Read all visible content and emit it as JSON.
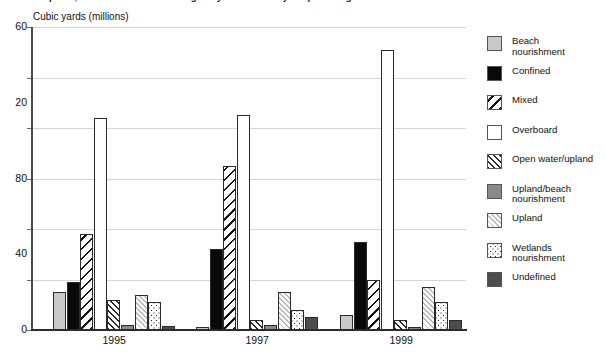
{
  "chart_title": "Disposal, 1995-1999: amount dredged by the U.S. Army Corps of Engineers",
  "y_axis_title": "Cubic yards (millions)",
  "legend": {
    "items": [
      {
        "label": "Beach\nnourishment",
        "pattern": "solid-light-gray",
        "key": "beach"
      },
      {
        "label": "Confined",
        "pattern": "solid-black",
        "key": "confined"
      },
      {
        "label": "Mixed",
        "pattern": "diagonal-hatch-coarse",
        "key": "mixed"
      },
      {
        "label": "Overboard",
        "pattern": "solid-white",
        "key": "overboard"
      },
      {
        "label": "Open water/upland",
        "pattern": "diagonal-hatch-fine",
        "key": "openwater"
      },
      {
        "label": "Upland/beach\nnourishment",
        "pattern": "solid-mid-gray",
        "key": "uplandbeach"
      },
      {
        "label": "Upland",
        "pattern": "diagonal-hatch-light",
        "key": "upland"
      },
      {
        "label": "Wetlands\nnourishment",
        "pattern": "dotted",
        "key": "wetlands"
      },
      {
        "label": "Undefined",
        "pattern": "solid-dark-gray",
        "key": "undefined"
      }
    ]
  },
  "chart_data": {
    "type": "bar",
    "title": "Disposal, 1995-1999: amount dredged by the U.S. Army Corps of Engineers",
    "xlabel": "",
    "ylabel": "Cubic yards (millions)",
    "categories": [
      "1995",
      "1997",
      "1999"
    ],
    "ytick_labels": [
      "60",
      "20",
      "80",
      "40",
      "0"
    ],
    "ytick_values": [
      60,
      50,
      40,
      30,
      20,
      10,
      0
    ],
    "ylim": [
      0,
      60
    ],
    "grid": true,
    "legend_position": "right",
    "series": [
      {
        "name": "Beach nourishment",
        "values": [
          7.5,
          0.5,
          3.0
        ]
      },
      {
        "name": "Confined",
        "values": [
          9.5,
          16.0,
          17.5
        ]
      },
      {
        "name": "Mixed",
        "values": [
          19.0,
          32.5,
          10.0
        ]
      },
      {
        "name": "Overboard",
        "values": [
          42.0,
          42.5,
          55.5
        ]
      },
      {
        "name": "Open water/upland",
        "values": [
          6.0,
          2.0,
          2.0
        ]
      },
      {
        "name": "Upland/beach nourishment",
        "values": [
          0.9,
          1.0,
          0.6
        ]
      },
      {
        "name": "Upland",
        "values": [
          7.0,
          7.5,
          8.5
        ]
      },
      {
        "name": "Wetlands nourishment",
        "values": [
          5.5,
          4.0,
          5.5
        ]
      },
      {
        "name": "Undefined",
        "values": [
          0.7,
          2.5,
          2.0
        ]
      }
    ]
  }
}
